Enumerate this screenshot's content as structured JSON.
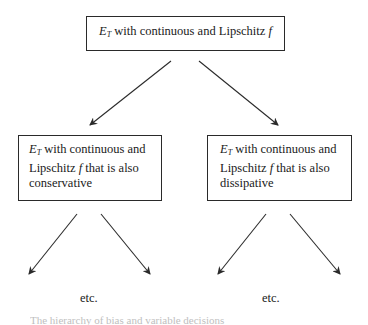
{
  "diagram": {
    "root": {
      "symbol": "E",
      "subscript": "T",
      "text": " with continuous and Lipschitz ",
      "func": "f"
    },
    "children": [
      {
        "id": "conservative",
        "symbol": "E",
        "subscript": "T",
        "line1": " with continuous and",
        "line2_prefix": "Lipschitz ",
        "func": "f",
        "line2_suffix": " that is also",
        "line3": "conservative"
      },
      {
        "id": "dissipative",
        "symbol": "E",
        "subscript": "T",
        "line1": " with continuous and",
        "line2_prefix": "Lipschitz ",
        "func": "f",
        "line2_suffix": " that is also",
        "line3": "dissipative"
      }
    ],
    "continuation_labels": [
      "etc.",
      "etc."
    ],
    "caption_fragment": "The hierarchy of bias and variable decisions",
    "edges": [
      {
        "from": "root",
        "to": "conservative"
      },
      {
        "from": "root",
        "to": "dissipative"
      },
      {
        "from": "conservative",
        "to": "etc-left-1"
      },
      {
        "from": "conservative",
        "to": "etc-left-2"
      },
      {
        "from": "dissipative",
        "to": "etc-right-1"
      },
      {
        "from": "dissipative",
        "to": "etc-right-2"
      }
    ],
    "colors": {
      "stroke": "#2a2a2a",
      "text": "#1a1a1a",
      "background": "#ffffff"
    }
  }
}
